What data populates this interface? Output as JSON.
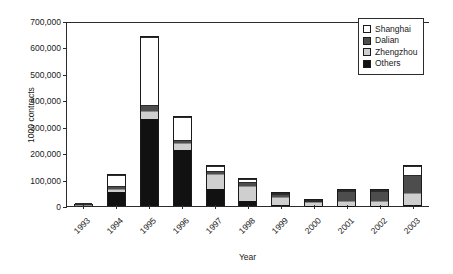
{
  "chart_data": {
    "type": "bar",
    "stacked": true,
    "title": "",
    "xlabel": "Year",
    "ylabel": "1000 contracts",
    "categories": [
      "1993",
      "1994",
      "1995",
      "1996",
      "1997",
      "1998",
      "1999",
      "2000",
      "2001",
      "2002",
      "2003"
    ],
    "ylim": [
      0,
      700000
    ],
    "ytick_values": [
      0,
      100000,
      200000,
      300000,
      400000,
      500000,
      600000,
      700000
    ],
    "ytick_labels": [
      "0",
      "100,000",
      "200,000",
      "300,000",
      "400,000",
      "500,000",
      "600,000",
      "700,000"
    ],
    "grid": false,
    "legend_position": "top-right",
    "series": [
      {
        "name": "Others",
        "color": "#111111",
        "values": [
          6000,
          55000,
          330000,
          215000,
          65000,
          18000,
          3000,
          2000,
          2000,
          2000,
          3000
        ]
      },
      {
        "name": "Zhengzhou",
        "color": "#cfcfcf",
        "values": [
          1000,
          10000,
          30000,
          28000,
          60000,
          62000,
          37000,
          16000,
          18000,
          18000,
          48000
        ]
      },
      {
        "name": "Dalian",
        "color": "#4d4d4d",
        "values": [
          1000,
          12000,
          25000,
          8000,
          12000,
          14000,
          10000,
          7000,
          43000,
          40000,
          68000
        ]
      },
      {
        "name": "Shanghai",
        "color": "#ffffff",
        "values": [
          1000,
          43000,
          260000,
          89000,
          18000,
          11000,
          2000,
          2000,
          2000,
          4000,
          36000
        ]
      }
    ],
    "totals": [
      9000,
      120000,
      645000,
      340000,
      155000,
      105000,
      52000,
      27000,
      65000,
      64000,
      155000
    ]
  },
  "legend": {
    "items": [
      {
        "label": "Shanghai",
        "swatch": "#ffffff"
      },
      {
        "label": "Dalian",
        "swatch": "#4d4d4d"
      },
      {
        "label": "Zhengzhou",
        "swatch": "#cfcfcf"
      },
      {
        "label": "Others",
        "swatch": "#111111"
      }
    ]
  }
}
